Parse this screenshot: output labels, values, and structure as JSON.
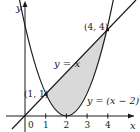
{
  "diagram": {
    "axes": {
      "x_label": "x",
      "y_label": "y",
      "x_ticks": [
        "0",
        "1",
        "2",
        "3",
        "4"
      ],
      "origin_px": [
        25,
        116
      ],
      "scale_px": [
        20.7,
        21.5
      ]
    },
    "curves": [
      {
        "name": "line",
        "label": "y = x"
      },
      {
        "name": "parabola",
        "label": "y = (x − 2)",
        "exponent": "2"
      }
    ],
    "points": [
      {
        "label": "(1, 1)",
        "x": 1,
        "y": 1
      },
      {
        "label": "(4, 4)",
        "x": 4,
        "y": 4
      }
    ],
    "shaded_region": {
      "from_x": 1,
      "to_x": 4,
      "upper": "y = x",
      "lower": "y = (x − 2)^2"
    },
    "colors": {
      "stroke": "#1a1a1a",
      "shade": "#d9d9d9",
      "background": "#ffffff"
    }
  }
}
